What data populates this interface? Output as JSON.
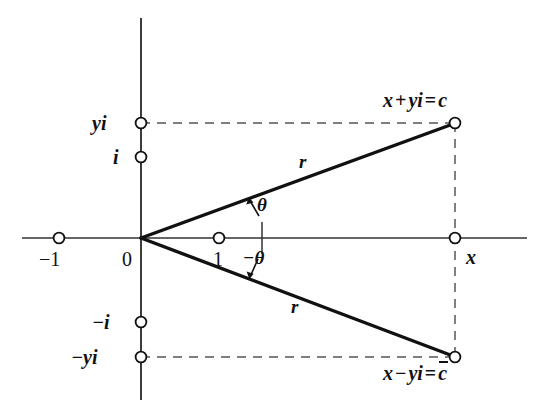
{
  "figure": {
    "width": 547,
    "height": 417,
    "background": "#ffffff",
    "stroke_color": "#111111",
    "dash_color": "#555555"
  },
  "axes": {
    "real_axis": {
      "name": "real-axis",
      "y": 238,
      "x_start": 22,
      "x_end": 527
    },
    "imaginary_axis": {
      "name": "imaginary-axis",
      "x": 141,
      "y_start": 18,
      "y_end": 400
    },
    "origin": {
      "x": 141,
      "y": 238
    }
  },
  "labels": {
    "yi": "yi",
    "i": "i",
    "neg_i": "−i",
    "neg_yi": "−yi",
    "neg_one": "−1",
    "zero": "0",
    "one": "1",
    "x": "x",
    "theta": "θ",
    "neg_theta": "−θ",
    "r_upper": "r",
    "r_lower": "r",
    "c_equation": "x + yi = c",
    "c_equation_parts": {
      "x": "x",
      "plus": "+",
      "yi": "yi",
      "equals": "=",
      "c": "c"
    },
    "cbar_equation": "x − yi = c̄",
    "cbar_equation_parts": {
      "x": "x",
      "minus": "−",
      "yi": "yi",
      "equals": "=",
      "cbar": "c"
    }
  },
  "points": [
    {
      "name": "point-neg-one",
      "label": "−1",
      "x": 59,
      "y": 238
    },
    {
      "name": "point-one",
      "label": "1",
      "x": 219,
      "y": 238
    },
    {
      "name": "point-x",
      "label": "x",
      "x": 455,
      "y": 238
    },
    {
      "name": "point-yi",
      "label": "yi",
      "x": 141,
      "y": 123
    },
    {
      "name": "point-i",
      "label": "i",
      "x": 141,
      "y": 157
    },
    {
      "name": "point-neg-i",
      "label": "−i",
      "x": 141,
      "y": 322
    },
    {
      "name": "point-neg-yi",
      "label": "−yi",
      "x": 141,
      "y": 357
    },
    {
      "name": "point-c",
      "label": "x + yi = c",
      "x": 455,
      "y": 123
    },
    {
      "name": "point-c-conjugate",
      "label": "x − yi = c̄",
      "x": 455,
      "y": 357
    }
  ],
  "rays": [
    {
      "name": "ray-to-c",
      "from": [
        141,
        238
      ],
      "to": [
        455,
        123
      ],
      "label": "r"
    },
    {
      "name": "ray-to-c-conjugate",
      "from": [
        141,
        238
      ],
      "to": [
        455,
        357
      ],
      "label": "r"
    }
  ],
  "dashed_lines": [
    {
      "name": "dashed-yi-to-c",
      "from": [
        141,
        123
      ],
      "to": [
        455,
        123
      ]
    },
    {
      "name": "dashed-neg-yi-to-cbar",
      "from": [
        141,
        357
      ],
      "to": [
        455,
        357
      ]
    },
    {
      "name": "dashed-vertical-x",
      "from": [
        455,
        123
      ],
      "to": [
        455,
        357
      ]
    }
  ],
  "angle_marks": {
    "reference_tick": {
      "name": "angle-reference-tick",
      "x": 262,
      "y_top": 222,
      "y_bottom": 254
    },
    "theta_arrow": {
      "name": "theta-angle-arrow",
      "from": [
        258,
        218
      ],
      "to": [
        248,
        200
      ]
    },
    "neg_theta_arrow": {
      "name": "neg-theta-angle-arrow",
      "from": [
        258,
        258
      ],
      "to": [
        250,
        278
      ]
    }
  }
}
